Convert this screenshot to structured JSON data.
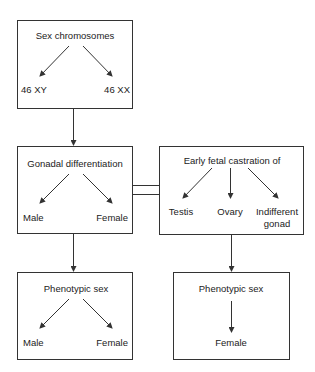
{
  "diagram": {
    "box1": {
      "title": "Sex chromosomes",
      "left_outcome": "46 XY",
      "right_outcome": "46 XX"
    },
    "box2": {
      "title": "Gonadal differentiation",
      "left_outcome": "Male",
      "right_outcome": "Female"
    },
    "box3": {
      "title": "Early fetal castration of",
      "outcomes": [
        "Testis",
        "Ovary",
        "Indifferent",
        "gonad"
      ]
    },
    "box4": {
      "title": "Phenotypic sex",
      "left_outcome": "Male",
      "right_outcome": "Female"
    },
    "box5": {
      "title": "Phenotypic sex",
      "outcome": "Female"
    },
    "colors": {
      "stroke": "#333333",
      "text": "#222222",
      "background": "#ffffff"
    }
  }
}
